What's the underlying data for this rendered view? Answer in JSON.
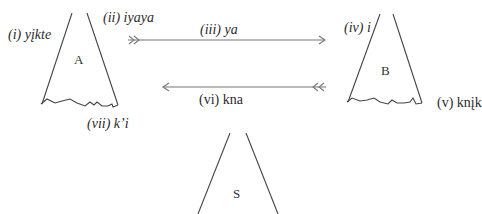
{
  "diagram": {
    "stroke_color": "#444444",
    "arrow_color": "#777777",
    "tipis": [
      {
        "id": "A",
        "letter": "A"
      },
      {
        "id": "B",
        "letter": "B"
      },
      {
        "id": "S",
        "letter": "S"
      }
    ],
    "labels": {
      "i": "(i) yįkte",
      "ii": "(ii) iyaya",
      "iii": "(iii) ya",
      "iv": "(iv) i",
      "v": "(v) knįk",
      "vi": "(vi) kna",
      "vii": "(vii) k’i"
    },
    "arrows": [
      {
        "id": "iyaya-ya",
        "direction": "A-to-B",
        "tail": "double-chevron",
        "head": "chevron"
      },
      {
        "id": "kna",
        "direction": "B-to-A",
        "tail": "double-chevron",
        "head": "chevron"
      }
    ]
  }
}
